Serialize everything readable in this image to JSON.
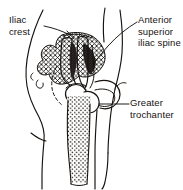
{
  "figure": {
    "view": "posterolateral view of right hip and thigh with examiner's hand",
    "background_color": "#ffffff",
    "ink_color": "#16120f"
  },
  "labels": [
    {
      "id": "iliac-crest",
      "text": "Iliac\ncrest",
      "line1": "Iliac",
      "line2": "crest",
      "position": "top-left",
      "leader": "points right to the crest of the ilium"
    },
    {
      "id": "anterior-superior-iliac-spine",
      "text": "Anterior\nsuperior\niliac spine",
      "line1": "Anterior",
      "line2": "superior",
      "line3": "iliac spine",
      "position": "top-right",
      "leader": "points down-left to the anterior superior iliac spine"
    },
    {
      "id": "greater-trochanter",
      "text": "Greater\ntrochanter",
      "line1": "Greater",
      "line2": "trochanter",
      "position": "right-middle",
      "leader": "points left to the greater trochanter of the femur"
    }
  ],
  "anatomy": {
    "regions": [
      {
        "name": "ilium",
        "texture": "crosshatch",
        "note": "wing of ilium, hatched"
      },
      {
        "name": "femur-shaft",
        "texture": "stipple",
        "note": "shaft of femur, dotted"
      },
      {
        "name": "femoral-head",
        "texture": "outline",
        "note": "rounded head at hip joint"
      },
      {
        "name": "greater-trochanter",
        "texture": "outline",
        "note": "lateral bony prominence"
      },
      {
        "name": "examiners-hand",
        "texture": "outline",
        "note": "fingers and thumb over hip"
      },
      {
        "name": "body-contour",
        "texture": "outline",
        "note": "torso, buttock and thigh outline"
      }
    ]
  }
}
